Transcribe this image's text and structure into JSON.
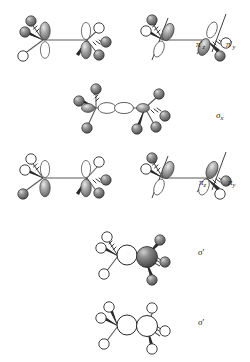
{
  "figure": {
    "background_color": "#ffffff",
    "sphere_dark_color": "#6e6e6e",
    "sphere_light_color": "#ffffff",
    "outline_color": "#1a1a1a",
    "bond_color": "#777777"
  },
  "structures": [
    {
      "id": "pi-prime-z",
      "label_text": "π",
      "label_prime": "′",
      "label_sub": "z",
      "row": 1,
      "column": "left",
      "orbital_type": "pi-antibonding",
      "orbital_axis": "z",
      "nodal_line": false,
      "atom_color": "dark"
    },
    {
      "id": "pi-prime-y",
      "label_text": "π",
      "label_prime": "′",
      "label_sub": "y",
      "row": 1,
      "column": "right",
      "orbital_type": "pi-antibonding",
      "orbital_axis": "y",
      "nodal_line": true,
      "atom_color": "dark"
    },
    {
      "id": "sigma-x",
      "label_text": "σ",
      "label_prime": "",
      "label_sub": "x",
      "row": 2,
      "column": "center",
      "orbital_type": "sigma-bonding",
      "orbital_axis": "x",
      "nodal_line": false,
      "atom_color": "dark"
    },
    {
      "id": "pi-z",
      "label_text": "π",
      "label_prime": "",
      "label_sub": "z",
      "row": 3,
      "column": "left",
      "orbital_type": "pi-bonding",
      "orbital_axis": "z",
      "nodal_line": false,
      "atom_color": "dark"
    },
    {
      "id": "pi-y",
      "label_text": "π",
      "label_prime": "",
      "label_sub": "y",
      "row": 3,
      "column": "right",
      "orbital_type": "pi-bonding",
      "orbital_axis": "y",
      "nodal_line": true,
      "atom_color": "dark"
    },
    {
      "id": "sigma-prime-1",
      "label_text": "σ",
      "label_prime": "′",
      "label_sub": "",
      "row": 4,
      "column": "center",
      "orbital_type": "sigma-prime",
      "orbital_axis": "",
      "nodal_line": false,
      "atom_color": "mixed"
    },
    {
      "id": "sigma-prime-2",
      "label_text": "σ",
      "label_prime": "′",
      "label_sub": "",
      "row": 5,
      "column": "center",
      "orbital_type": "sigma-prime",
      "orbital_axis": "",
      "nodal_line": false,
      "atom_color": "light"
    }
  ],
  "labels": {
    "pi_prime_z": {
      "base": "π",
      "prime": "′",
      "sub": "z"
    },
    "pi_prime_y": {
      "base": "π",
      "prime": "′",
      "sub": "y"
    },
    "sigma_x": {
      "base": "σ",
      "prime": "",
      "sub": "x"
    },
    "pi_z": {
      "base": "π",
      "prime": "",
      "sub": "z"
    },
    "pi_y": {
      "base": "π",
      "prime": "",
      "sub": "y"
    },
    "sigma_p1": {
      "base": "σ",
      "prime": "′",
      "sub": ""
    },
    "sigma_p2": {
      "base": "σ",
      "prime": "′",
      "sub": ""
    }
  }
}
